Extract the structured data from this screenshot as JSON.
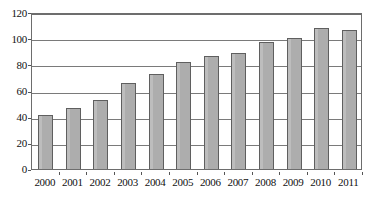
{
  "chart_data": {
    "type": "bar",
    "title": "",
    "subtitle": "",
    "xlabel": "",
    "ylabel": "",
    "categories": [
      "2000",
      "2001",
      "2002",
      "2003",
      "2004",
      "2005",
      "2006",
      "2007",
      "2008",
      "2009",
      "2010",
      "2011"
    ],
    "values": [
      41,
      47,
      53,
      66,
      73,
      82,
      86,
      89,
      97,
      100,
      108,
      106
    ],
    "ylim": [
      0,
      120
    ],
    "ytick_labels": [
      "0",
      "20",
      "40",
      "60",
      "80",
      "100",
      "120"
    ],
    "ytick_values": [
      0,
      20,
      40,
      60,
      80,
      100,
      120
    ],
    "grid": true,
    "legend": false,
    "legend_position": "none",
    "series": [
      {
        "name": "",
        "values": [
          41,
          47,
          53,
          66,
          73,
          82,
          86,
          89,
          97,
          100,
          108,
          106
        ]
      }
    ],
    "annotations": []
  },
  "style": {
    "bar_fill": "#adadad",
    "bar_border": "#5f5f5f",
    "grid_color": "#7a7a7a",
    "axis_color": "#6d6d6d",
    "text_color": "#111111",
    "background": "#ffffff"
  }
}
